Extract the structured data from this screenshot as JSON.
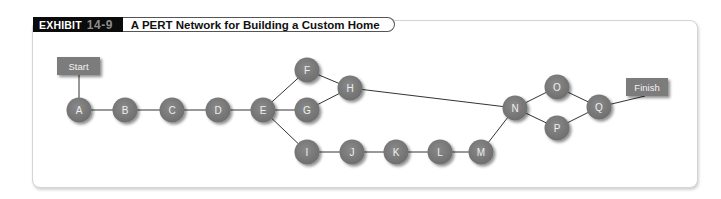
{
  "header": {
    "exhibit_label": "EXHIBIT",
    "exhibit_number": "14-9",
    "title": "A PERT Network for Building a Custom Home"
  },
  "colors": {
    "node_fill": "#7a7a7a",
    "edge": "#333333",
    "header_bg": "#0b0b0b",
    "exhibit_number": "#8c8c8c"
  },
  "network": {
    "start": {
      "label": "Start"
    },
    "finish": {
      "label": "Finish"
    },
    "nodes": {
      "A": "A",
      "B": "B",
      "C": "C",
      "D": "D",
      "E": "E",
      "F": "F",
      "G": "G",
      "H": "H",
      "I": "I",
      "J": "J",
      "K": "K",
      "L": "L",
      "M": "M",
      "N": "N",
      "O": "O",
      "P": "P",
      "Q": "Q"
    },
    "edges": [
      [
        "Start",
        "A"
      ],
      [
        "A",
        "B"
      ],
      [
        "B",
        "C"
      ],
      [
        "C",
        "D"
      ],
      [
        "D",
        "E"
      ],
      [
        "E",
        "F"
      ],
      [
        "E",
        "G"
      ],
      [
        "E",
        "I"
      ],
      [
        "F",
        "H"
      ],
      [
        "G",
        "H"
      ],
      [
        "H",
        "N"
      ],
      [
        "I",
        "J"
      ],
      [
        "J",
        "K"
      ],
      [
        "K",
        "L"
      ],
      [
        "L",
        "M"
      ],
      [
        "M",
        "N"
      ],
      [
        "N",
        "O"
      ],
      [
        "N",
        "P"
      ],
      [
        "O",
        "Q"
      ],
      [
        "P",
        "Q"
      ],
      [
        "Q",
        "Finish"
      ]
    ]
  }
}
